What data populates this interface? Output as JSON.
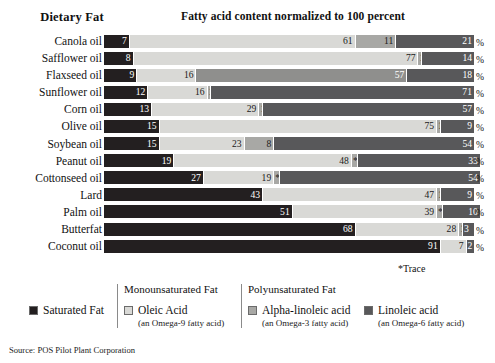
{
  "header": {
    "category_label": "Dietary Fat",
    "title": "Fatty acid content normalized to 100 percent"
  },
  "percent_symbol": "%",
  "trace_note": "*Trace",
  "source": "Source: POS Pilot Plant Corporation",
  "colors": {
    "saturated": "#231f20",
    "oleic": "#d9d9d6",
    "alpha_linolenic": "#a8a8a5",
    "linoleic": "#58585a",
    "background": "#ffffff"
  },
  "legend": {
    "group_headers": [
      "Monounsaturated Fat",
      "Polyunsaturated Fat"
    ],
    "items": [
      {
        "label": "Saturated Fat",
        "sub": "",
        "color": "#231f20"
      },
      {
        "label": "Oleic Acid",
        "sub": "(an Omega-9 fatty acid)",
        "color": "#d9d9d6"
      },
      {
        "label": "Alpha-linoleic acid",
        "sub": "(an Omega-3 fatty acid)",
        "color": "#a8a8a5"
      },
      {
        "label": "Linoleic acid",
        "sub": "(an Omega-6 fatty acid)",
        "color": "#58585a"
      }
    ]
  },
  "chart_data": {
    "type": "bar",
    "orientation": "horizontal",
    "stacked": true,
    "normalized_to": 100,
    "title": "Fatty acid content normalized to 100 percent",
    "xlabel": "",
    "ylabel": "Dietary Fat",
    "xlim": [
      0,
      100
    ],
    "grid": false,
    "legend_position": "bottom",
    "categories": [
      "Canola oil",
      "Safflower oil",
      "Flaxseed oil",
      "Sunflower oil",
      "Corn oil",
      "Olive oil",
      "Soybean oil",
      "Peanut oil",
      "Cottonseed oil",
      "Lard",
      "Palm oil",
      "Butterfat",
      "Coconut oil"
    ],
    "series": [
      {
        "name": "Saturated Fat",
        "key": "sat",
        "values": [
          7,
          8,
          9,
          12,
          13,
          15,
          15,
          19,
          27,
          43,
          51,
          68,
          91
        ]
      },
      {
        "name": "Oleic Acid",
        "key": "ole",
        "values": [
          61,
          77,
          16,
          16,
          29,
          75,
          23,
          48,
          19,
          47,
          39,
          28,
          7
        ]
      },
      {
        "name": "Alpha-linoleic acid",
        "key": "ala",
        "values": [
          11,
          1,
          57,
          1,
          1,
          1,
          8,
          0,
          0,
          1,
          0,
          1,
          0
        ]
      },
      {
        "name": "Linoleic acid",
        "key": "lin",
        "values": [
          21,
          14,
          18,
          71,
          57,
          9,
          54,
          33,
          54,
          9,
          10,
          3,
          2
        ]
      }
    ],
    "rows": [
      {
        "label": "Canola oil",
        "segments": [
          {
            "key": "sat",
            "value": 7,
            "text": "7"
          },
          {
            "key": "ole",
            "value": 61,
            "text": "61"
          },
          {
            "key": "ala",
            "value": 11,
            "text": "11"
          },
          {
            "key": "lin",
            "value": 21,
            "text": "21"
          }
        ]
      },
      {
        "label": "Safflower oil",
        "segments": [
          {
            "key": "sat",
            "value": 8,
            "text": "8"
          },
          {
            "key": "ole",
            "value": 77,
            "text": "77"
          },
          {
            "key": "ala",
            "value": 1,
            "text": "1"
          },
          {
            "key": "lin",
            "value": 14,
            "text": "14"
          }
        ]
      },
      {
        "label": "Flaxseed oil",
        "segments": [
          {
            "key": "sat",
            "value": 9,
            "text": "9"
          },
          {
            "key": "ole",
            "value": 16,
            "text": "16"
          },
          {
            "key": "ala",
            "value": 57,
            "text": "57"
          },
          {
            "key": "lin",
            "value": 18,
            "text": "18"
          }
        ]
      },
      {
        "label": "Sunflower oil",
        "segments": [
          {
            "key": "sat",
            "value": 12,
            "text": "12"
          },
          {
            "key": "ole",
            "value": 16,
            "text": "16"
          },
          {
            "key": "ala",
            "value": 1,
            "text": "1"
          },
          {
            "key": "lin",
            "value": 71,
            "text": "71"
          }
        ]
      },
      {
        "label": "Corn oil",
        "segments": [
          {
            "key": "sat",
            "value": 13,
            "text": "13"
          },
          {
            "key": "ole",
            "value": 29,
            "text": "29"
          },
          {
            "key": "ala",
            "value": 1,
            "text": "1"
          },
          {
            "key": "lin",
            "value": 57,
            "text": "57"
          }
        ]
      },
      {
        "label": "Olive oil",
        "segments": [
          {
            "key": "sat",
            "value": 15,
            "text": "15"
          },
          {
            "key": "ole",
            "value": 75,
            "text": "75"
          },
          {
            "key": "ala",
            "value": 1,
            "text": "1"
          },
          {
            "key": "lin",
            "value": 9,
            "text": "9"
          }
        ]
      },
      {
        "label": "Soybean oil",
        "segments": [
          {
            "key": "sat",
            "value": 15,
            "text": "15"
          },
          {
            "key": "ole",
            "value": 23,
            "text": "23"
          },
          {
            "key": "ala",
            "value": 8,
            "text": "8"
          },
          {
            "key": "lin",
            "value": 54,
            "text": "54"
          }
        ]
      },
      {
        "label": "Peanut oil",
        "segments": [
          {
            "key": "sat",
            "value": 19,
            "text": "19"
          },
          {
            "key": "ole",
            "value": 48,
            "text": "48"
          },
          {
            "key": "ala",
            "value": 0,
            "text": "*"
          },
          {
            "key": "lin",
            "value": 33,
            "text": "33"
          }
        ]
      },
      {
        "label": "Cottonseed oil",
        "segments": [
          {
            "key": "sat",
            "value": 27,
            "text": "27"
          },
          {
            "key": "ole",
            "value": 19,
            "text": "19"
          },
          {
            "key": "ala",
            "value": 0,
            "text": "*"
          },
          {
            "key": "lin",
            "value": 54,
            "text": "54"
          }
        ]
      },
      {
        "label": "Lard",
        "segments": [
          {
            "key": "sat",
            "value": 43,
            "text": "43"
          },
          {
            "key": "ole",
            "value": 47,
            "text": "47"
          },
          {
            "key": "ala",
            "value": 1,
            "text": "1"
          },
          {
            "key": "lin",
            "value": 9,
            "text": "9"
          }
        ]
      },
      {
        "label": "Palm oil",
        "segments": [
          {
            "key": "sat",
            "value": 51,
            "text": "51"
          },
          {
            "key": "ole",
            "value": 39,
            "text": "39"
          },
          {
            "key": "ala",
            "value": 0,
            "text": "*"
          },
          {
            "key": "lin",
            "value": 10,
            "text": "10"
          }
        ]
      },
      {
        "label": "Butterfat",
        "segments": [
          {
            "key": "sat",
            "value": 68,
            "text": "68"
          },
          {
            "key": "ole",
            "value": 28,
            "text": "28"
          },
          {
            "key": "ala",
            "value": 1,
            "text": "1"
          },
          {
            "key": "lin",
            "value": 3,
            "text": "3"
          }
        ]
      },
      {
        "label": "Coconut oil",
        "segments": [
          {
            "key": "sat",
            "value": 91,
            "text": "91"
          },
          {
            "key": "ole",
            "value": 7,
            "text": "7"
          },
          {
            "key": "lin",
            "value": 2,
            "text": "2"
          }
        ]
      }
    ]
  }
}
